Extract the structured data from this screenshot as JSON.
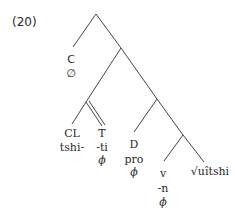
{
  "example_number": "(20)",
  "colors": {
    "line": "#444444",
    "text": "#2a2a2a",
    "background": "#ffffff"
  },
  "tree": {
    "C": {
      "label": "C",
      "exponent": "∅"
    },
    "CL": {
      "label": "CL",
      "exponent": "tshi-"
    },
    "T": {
      "label": "T",
      "exponent": "-ti",
      "content": "ϕ"
    },
    "D": {
      "label": "D",
      "exponent": "pro",
      "content": "ϕ"
    },
    "v": {
      "label": "v",
      "exponent": "-n",
      "content": "ϕ"
    },
    "root": {
      "label": "√uîtshi"
    }
  }
}
